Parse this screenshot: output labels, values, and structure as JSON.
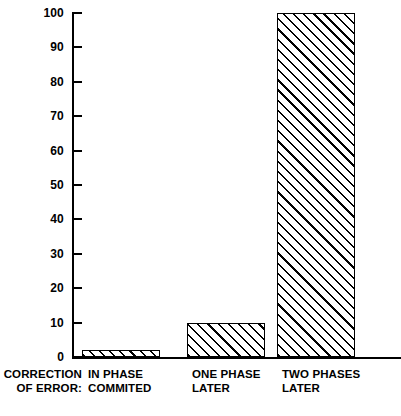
{
  "chart_data": {
    "type": "bar",
    "title": "",
    "xlabel": "CORRECTION OF ERROR:",
    "ylabel": "",
    "categories": [
      "IN PHASE COMMITED",
      "ONE PHASE LATER",
      "TWO PHASES LATER"
    ],
    "category_lines": [
      [
        "IN PHASE",
        "COMMITED"
      ],
      [
        "ONE PHASE",
        "LATER"
      ],
      [
        "TWO PHASES",
        "LATER"
      ]
    ],
    "values": [
      2,
      10,
      100
    ],
    "ylim": [
      0,
      100
    ],
    "yticks": [
      0,
      10,
      20,
      30,
      40,
      50,
      60,
      70,
      80,
      90,
      100
    ],
    "ytick_labels": [
      "0",
      "10",
      "20",
      "30",
      "40",
      "50",
      "60",
      "70",
      "80",
      "90",
      "100"
    ],
    "grid": false,
    "legend": "none",
    "bar_fill": "diagonal-hatch",
    "colors": {
      "line": "#000000",
      "fill": "#ffffff",
      "hatch": "#000000",
      "background": "#ffffff"
    }
  },
  "axis": {
    "caption": "CORRECTION\nOF ERROR:"
  },
  "categories": [
    {
      "line1": "IN PHASE",
      "line2": "COMMITED",
      "value": 2
    },
    {
      "line1": "ONE PHASE",
      "line2": "LATER",
      "value": 10
    },
    {
      "line1": "TWO PHASES",
      "line2": "LATER",
      "value": 100
    }
  ],
  "yticks": [
    {
      "label": "100"
    },
    {
      "label": "90"
    },
    {
      "label": "80"
    },
    {
      "label": "70"
    },
    {
      "label": "60"
    },
    {
      "label": "50"
    },
    {
      "label": "40"
    },
    {
      "label": "30"
    },
    {
      "label": "20"
    },
    {
      "label": "10"
    },
    {
      "label": "0"
    }
  ]
}
